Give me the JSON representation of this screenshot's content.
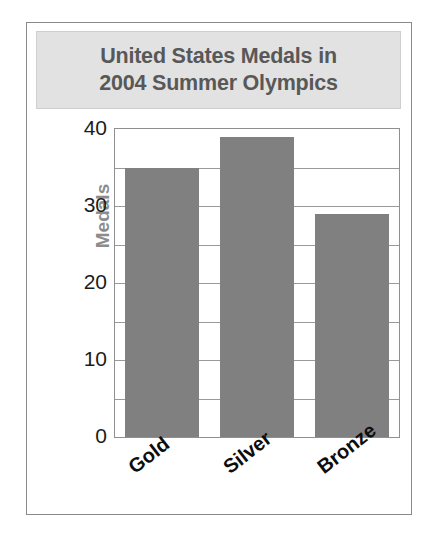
{
  "chart_data": {
    "type": "bar",
    "title": "United States Medals in\n2004 Summer Olympics",
    "categories": [
      "Gold",
      "Silver",
      "Bronze"
    ],
    "values": [
      35,
      39,
      29
    ],
    "xlabel": "",
    "ylabel": "Medals",
    "ylim": [
      0,
      40
    ],
    "yticks": [
      0,
      10,
      20,
      30,
      40
    ],
    "ytick_labels": [
      "0",
      "10",
      "20",
      "30",
      "40"
    ],
    "minor_tick_step": 5,
    "grid": true,
    "legend": false,
    "bar_color": "#808080",
    "title_background": "#e2e2e2",
    "title_color": "#585858",
    "axis_title_color": "#8c8c8c",
    "frame_color": "#8a8a8a"
  }
}
